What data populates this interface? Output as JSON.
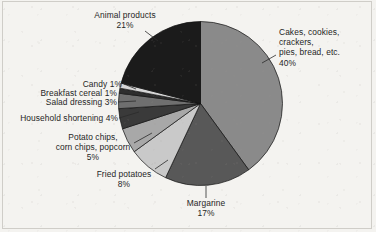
{
  "figure": {
    "background_color": "#f4f3f0",
    "frame_color": "#cfcdc8"
  },
  "chart_data": {
    "type": "pie",
    "title": "",
    "subtitle": "",
    "xlabel": "",
    "ylabel": "",
    "grid": false,
    "legend_position": "none",
    "labels_position": "outside-with-leader-lines",
    "start_angle_deg": 0,
    "direction": "clockwise",
    "units": "percent",
    "total": 100,
    "categories": [
      "Cakes, cookies, crackers, pies, bread, etc.",
      "Margarine",
      "Fried potatoes",
      "Potato chips, corn chips, popcorn",
      "Household shortening",
      "Salad dressing",
      "Breakfast cereal",
      "Candy",
      "Animal products"
    ],
    "values": [
      40,
      17,
      8,
      5,
      4,
      3,
      1,
      1,
      21
    ],
    "colors": [
      "#8a8a8a",
      "#585858",
      "#c9c9c9",
      "#a8a8a8",
      "#3a3a3a",
      "#6f6f6f",
      "#2e2e2e",
      "#d6d6d6",
      "#1b1b1b"
    ],
    "slice_edge_color": "#111111"
  },
  "labels": {
    "cakes": {
      "text": "Cakes, cookies, crackers,\npies, bread, etc.\n40%",
      "name": "Cakes, cookies, crackers, pies, bread, etc.",
      "value": "40%"
    },
    "margarine": {
      "text": "Margarine\n17%",
      "name": "Margarine",
      "value": "17%"
    },
    "fried_potatoes": {
      "text": "Fried potatoes\n8%",
      "name": "Fried potatoes",
      "value": "8%"
    },
    "potato_chips": {
      "text": "Potato chips,\ncorn chips, popcorn\n5%",
      "name": "Potato chips, corn chips, popcorn",
      "value": "5%"
    },
    "household_shortening": {
      "text": "Household shortening 4%",
      "name": "Household shortening",
      "value": "4%"
    },
    "salad_dressing": {
      "text": "Salad dressing 3%",
      "name": "Salad dressing",
      "value": "3%"
    },
    "breakfast_cereal": {
      "text": "Breakfast cereal 1%",
      "name": "Breakfast cereal",
      "value": "1%"
    },
    "candy": {
      "text": "Candy 1%",
      "name": "Candy",
      "value": "1%"
    },
    "animal_products": {
      "text": "Animal products\n21%",
      "name": "Animal products",
      "value": "21%"
    }
  }
}
